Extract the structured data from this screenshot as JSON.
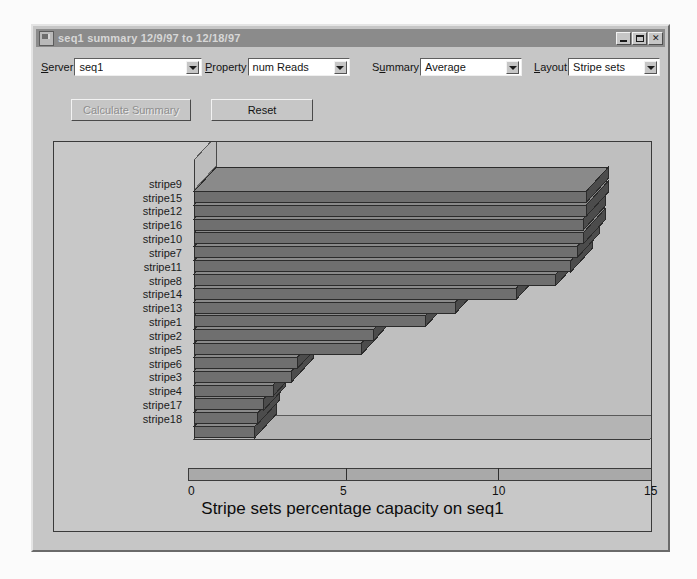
{
  "window": {
    "title": "seq1 summary 12/9/97 to 12/18/97",
    "icon": "app-icon",
    "buttons": {
      "minimize": "_",
      "maximize": "maximize-icon",
      "close": "✕"
    }
  },
  "controls": [
    {
      "key": "server",
      "label_pre": "",
      "label_mnemonic": "S",
      "label_post": "erver",
      "value": "seq1"
    },
    {
      "key": "property",
      "label_pre": "",
      "label_mnemonic": "P",
      "label_post": "roperty",
      "value": "num Reads"
    },
    {
      "key": "summary",
      "label_pre": "S",
      "label_mnemonic": "u",
      "label_post": "mmary",
      "value": "Average"
    },
    {
      "key": "layout",
      "label_pre": "",
      "label_mnemonic": "L",
      "label_post": "ayout",
      "value": "Stripe sets"
    }
  ],
  "actions": {
    "calculate_summary": "Calculate Summary",
    "calculate_summary_enabled": false,
    "reset": "Reset",
    "reset_enabled": true
  },
  "colors": {
    "window_face": "#c6c6c6",
    "titlebar": "#8b8b8b",
    "titlebar_text": "#d7d7d7",
    "plot_bg": "#c8c8c8",
    "bar_front": "#6f6f6f",
    "bar_top": "#8a8a8a",
    "bar_side": "#4c4c4c",
    "floor": "#b4b4b4",
    "wall": "#bfbfbf",
    "axis_line": "#3a3a3a"
  },
  "chart_data": {
    "type": "bar",
    "orientation": "horizontal",
    "style": "3d",
    "title": "Stripe sets percentage capacity on seq1",
    "xlabel": "",
    "ylabel": "",
    "xlim": [
      0,
      15
    ],
    "xticks": [
      0,
      5,
      10,
      15
    ],
    "xtick_labels": [
      "0",
      "5",
      "10",
      "15"
    ],
    "grid": false,
    "legend": "none",
    "categories": [
      "stripe9",
      "stripe15",
      "stripe12",
      "stripe16",
      "stripe10",
      "stripe7",
      "stripe11",
      "stripe8",
      "stripe14",
      "stripe13",
      "stripe1",
      "stripe2",
      "stripe5",
      "stripe6",
      "stripe3",
      "stripe4",
      "stripe17",
      "stripe18"
    ],
    "values": [
      12.9,
      12.9,
      12.8,
      12.8,
      12.6,
      12.4,
      11.9,
      10.6,
      8.6,
      7.6,
      5.9,
      5.5,
      3.4,
      3.2,
      2.6,
      2.3,
      2.1,
      2.0
    ]
  }
}
